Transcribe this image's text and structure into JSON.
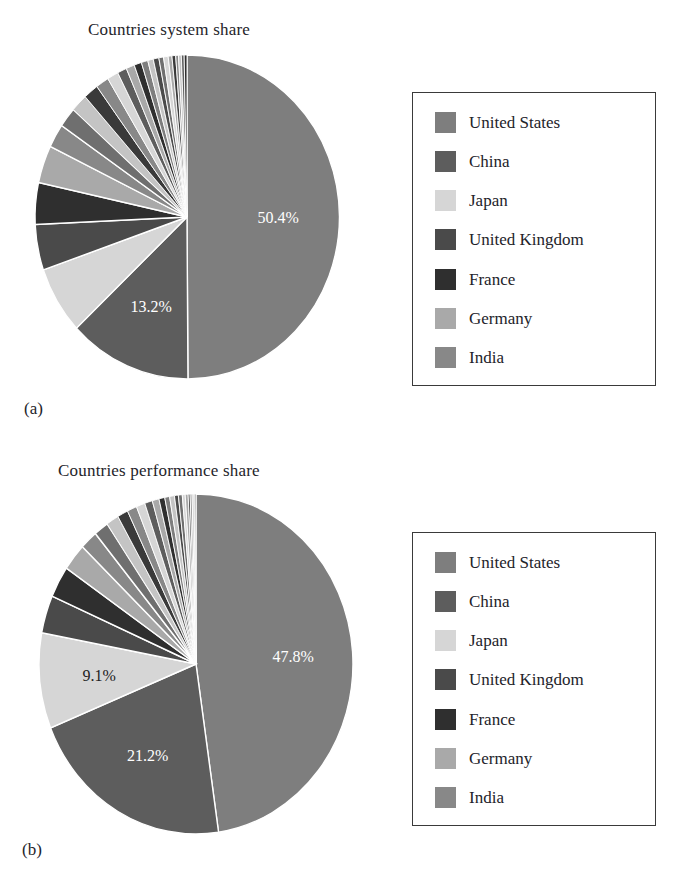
{
  "figure": {
    "background": "#ffffff",
    "panels": [
      {
        "tag": "(a)",
        "title": "Countries system share"
      },
      {
        "tag": "(b)",
        "title": "Countries performance share"
      }
    ]
  },
  "palette": {
    "united_states": "#7e7e7e",
    "china": "#5d5d5d",
    "japan": "#d6d6d6",
    "united_kingdom": "#4a4a4a",
    "france": "#2f2f2f",
    "germany": "#a9a9a9",
    "india": "#888888",
    "other_light": "#c4c4c4",
    "other_mid": "#6f6f6f",
    "other_dark": "#3a3a3a",
    "separator": "#ffffff",
    "legend_border": "#3a3a3a",
    "text": "#23232a",
    "label_light": "#ffffff",
    "label_dark": "#222222"
  },
  "legend": {
    "items": [
      {
        "label": "United States",
        "color": "#7e7e7e"
      },
      {
        "label": "China",
        "color": "#5d5d5d"
      },
      {
        "label": "Japan",
        "color": "#d6d6d6"
      },
      {
        "label": "United Kingdom",
        "color": "#4a4a4a"
      },
      {
        "label": "France",
        "color": "#2f2f2f"
      },
      {
        "label": "Germany",
        "color": "#a9a9a9"
      },
      {
        "label": "India",
        "color": "#888888"
      }
    ]
  },
  "chart_data": [
    {
      "type": "pie",
      "title": "Countries system share",
      "panel": "(a)",
      "start_angle_deg": 0,
      "direction": "clockwise",
      "legend_position": "right",
      "categories": [
        "United States",
        "China",
        "Japan",
        "United Kingdom",
        "France",
        "Germany",
        "India",
        "Canada",
        "Italy",
        "Netherlands",
        "Russia",
        "South Korea",
        "Sweden",
        "Poland",
        "Brazil",
        "Switzerland",
        "Australia",
        "Spain",
        "Saudi Arabia",
        "Norway",
        "Austria",
        "Taiwan",
        "Ireland",
        "Singapore",
        "Finland",
        "Others"
      ],
      "values": [
        50.4,
        13.2,
        6.8,
        4.6,
        4.2,
        3.8,
        2.4,
        2.0,
        1.8,
        1.6,
        1.4,
        1.2,
        1.0,
        0.9,
        0.8,
        0.7,
        0.6,
        0.6,
        0.5,
        0.5,
        0.4,
        0.4,
        0.3,
        0.3,
        0.3,
        0.3
      ],
      "labeled_slices": [
        {
          "category": "United States",
          "text": "50.4%"
        },
        {
          "category": "China",
          "text": "13.2%"
        }
      ],
      "unit": "%"
    },
    {
      "type": "pie",
      "title": "Countries performance share",
      "panel": "(b)",
      "start_angle_deg": 0,
      "direction": "clockwise",
      "legend_position": "right",
      "categories": [
        "United States",
        "China",
        "Japan",
        "United Kingdom",
        "France",
        "Germany",
        "India",
        "Canada",
        "Italy",
        "Netherlands",
        "Russia",
        "South Korea",
        "Sweden",
        "Poland",
        "Brazil",
        "Switzerland",
        "Australia",
        "Spain",
        "Saudi Arabia",
        "Norway",
        "Austria",
        "Taiwan",
        "Ireland",
        "Singapore",
        "Finland",
        "Others"
      ],
      "values": [
        47.8,
        21.2,
        9.1,
        3.6,
        3.0,
        2.6,
        1.8,
        1.5,
        1.3,
        1.1,
        1.0,
        0.9,
        0.8,
        0.7,
        0.6,
        0.5,
        0.5,
        0.4,
        0.4,
        0.3,
        0.3,
        0.2,
        0.2,
        0.2,
        0.1,
        0.1
      ],
      "labeled_slices": [
        {
          "category": "United States",
          "text": "47.8%"
        },
        {
          "category": "China",
          "text": "21.2%"
        },
        {
          "category": "Japan",
          "text": "9.1%"
        }
      ],
      "unit": "%"
    }
  ]
}
